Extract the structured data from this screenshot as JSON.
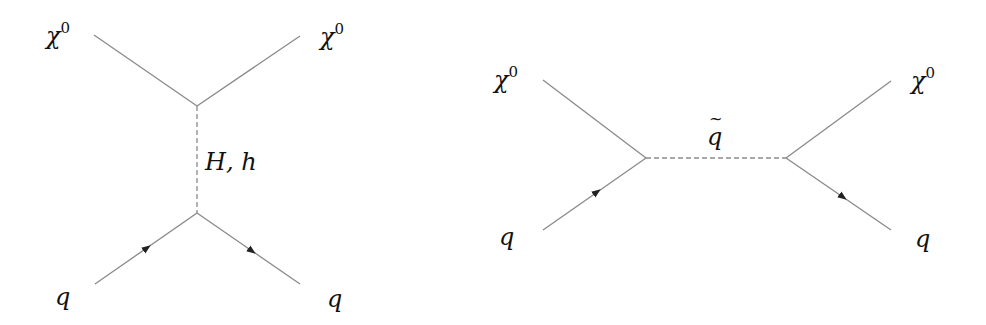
{
  "diagrams": [
    {
      "id": "t-channel-higgs",
      "labels": {
        "top_left": {
          "symbol": "χ",
          "sup": "0"
        },
        "top_right": {
          "symbol": "χ",
          "sup": "0"
        },
        "propagator": "H, h",
        "bottom_left": "q",
        "bottom_right": "q"
      }
    },
    {
      "id": "s-channel-squark",
      "labels": {
        "top_left": {
          "symbol": "χ",
          "sup": "0"
        },
        "top_right": {
          "symbol": "χ",
          "sup": "0"
        },
        "propagator": "q",
        "bottom_left": "q",
        "bottom_right": "q"
      }
    }
  ],
  "colors": {
    "line": "#8a8a8a",
    "arrow": "#222222",
    "text": "#111111"
  }
}
